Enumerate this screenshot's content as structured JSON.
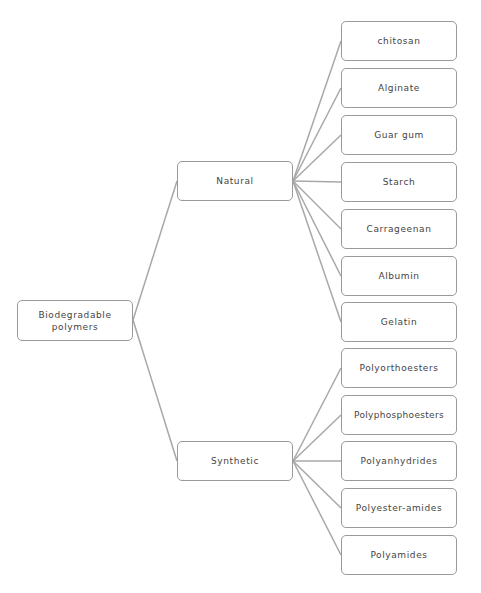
{
  "diagram": {
    "type": "tree",
    "line_color": "#a8a8a8",
    "border_color": "#9a9a9a",
    "text_color": "#444444",
    "root": {
      "label": "Biodegradable\npolymers",
      "label_lines": [
        "Biodegradable",
        "polymers"
      ]
    },
    "branches": [
      {
        "label": "Natural",
        "children": [
          "chitosan",
          "Alginate",
          "Guar gum",
          "Starch",
          "Carrageenan",
          "Albumin",
          "Gelatin"
        ]
      },
      {
        "label": "Synthetic",
        "children": [
          "Polyorthoesters",
          "Polyphosphoesters",
          "Polyanhydrides",
          "Polyester-amides",
          "Polyamides"
        ]
      }
    ]
  }
}
